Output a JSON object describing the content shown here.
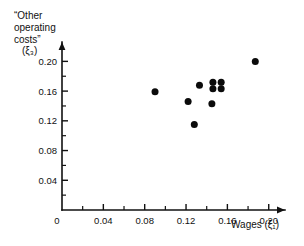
{
  "chart_data": {
    "type": "scatter",
    "title": "",
    "xlabel": "Wages (ξ₁)",
    "ylabel": "“Other operating costs” (ξ₃)",
    "ylabel_lines": [
      "“Other",
      "operating",
      "costs”",
      "(ξ₃)"
    ],
    "xlim": [
      0,
      0.208
    ],
    "ylim": [
      0,
      0.218
    ],
    "grid": false,
    "legend": null,
    "x_ticks": [
      0,
      0.04,
      0.08,
      0.12,
      0.16,
      0.2
    ],
    "x_tick_labels": [
      "0",
      "0.04",
      "0.08",
      "0.12",
      "0.16",
      "0.20"
    ],
    "y_ticks": [
      0.04,
      0.08,
      0.12,
      0.16,
      0.2
    ],
    "y_tick_labels": [
      "0.04",
      "0.08",
      "0.12",
      "0.16",
      "0.20"
    ],
    "x_minor_ticks": [
      0.02,
      0.06,
      0.1,
      0.14,
      0.18
    ],
    "y_minor_ticks": [
      0.02,
      0.06,
      0.1,
      0.14,
      0.18
    ],
    "marker": "filled-circle",
    "marker_color": "#0b0b0b",
    "marker_size_px": 4.6,
    "x": [
      0.09,
      0.122,
      0.128,
      0.133,
      0.145,
      0.146,
      0.146,
      0.154,
      0.154,
      0.187
    ],
    "y": [
      0.159,
      0.146,
      0.115,
      0.168,
      0.143,
      0.172,
      0.163,
      0.172,
      0.163,
      0.2
    ],
    "points": [
      {
        "x": 0.09,
        "y": 0.159
      },
      {
        "x": 0.122,
        "y": 0.146
      },
      {
        "x": 0.128,
        "y": 0.115
      },
      {
        "x": 0.133,
        "y": 0.168
      },
      {
        "x": 0.145,
        "y": 0.143
      },
      {
        "x": 0.146,
        "y": 0.172
      },
      {
        "x": 0.146,
        "y": 0.163
      },
      {
        "x": 0.154,
        "y": 0.172
      },
      {
        "x": 0.154,
        "y": 0.163
      },
      {
        "x": 0.187,
        "y": 0.2
      }
    ],
    "n_points": 10,
    "axis_color": "#111111",
    "background_color": "#ffffff"
  },
  "axes": {
    "x_axis_name": "wages-axis",
    "y_axis_name": "other-operating-costs-axis"
  }
}
